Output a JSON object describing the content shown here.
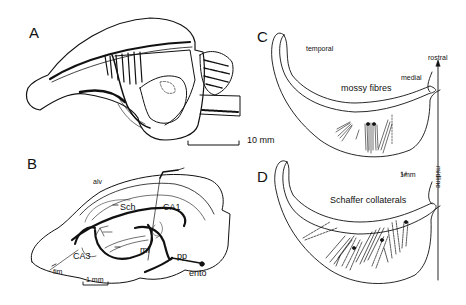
{
  "figure": {
    "panels": [
      {
        "id": "A",
        "label": "A",
        "scale_bar": "10 mm"
      },
      {
        "id": "B",
        "label": "B",
        "scale_bar": "1 mm",
        "annotations": [
          "alv",
          "Sch",
          "CA1",
          "CA3",
          "fim",
          "mf",
          "pp",
          "ento"
        ]
      },
      {
        "id": "C",
        "label": "C",
        "title": "mossy   fibres",
        "annotations": [
          "temporal",
          "medial",
          "rostral"
        ]
      },
      {
        "id": "D",
        "label": "D",
        "title": "Schaffer   collaterals",
        "annotations": [
          "midline",
          "1mm"
        ]
      }
    ]
  },
  "colors": {
    "ink": "#111111",
    "background": "#ffffff"
  }
}
